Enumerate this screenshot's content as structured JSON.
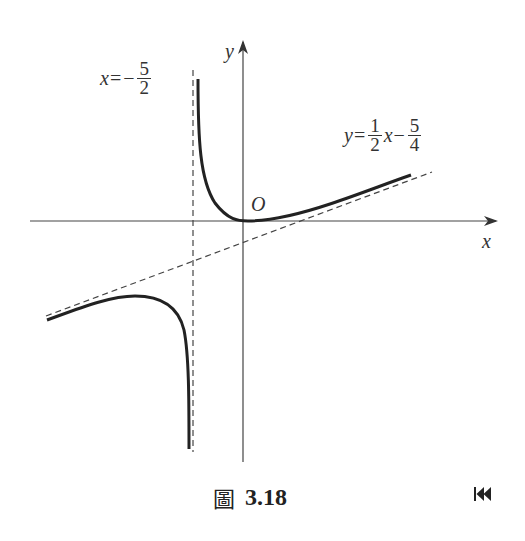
{
  "figure": {
    "caption_char": "圖",
    "caption_number": "3.18",
    "nav_button": "first-page"
  },
  "labels": {
    "y_axis": "y",
    "x_axis": "x",
    "origin": "O",
    "vertical_asymptote": {
      "lhs": "x",
      "op": "=",
      "sign": "−",
      "num": "5",
      "den": "2"
    },
    "slant_asymptote": {
      "lhs": "y",
      "op": "=",
      "num1": "1",
      "den1": "2",
      "var": "x",
      "sign": "−",
      "num2": "5",
      "den2": "4"
    }
  },
  "colors": {
    "curve": "#222222",
    "axis": "#444444",
    "asymptote": "#444444"
  }
}
